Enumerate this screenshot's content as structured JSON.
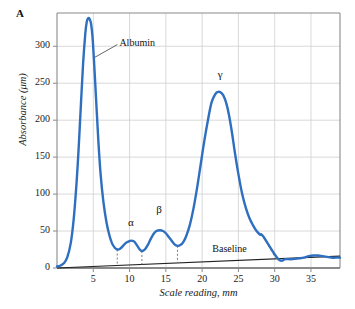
{
  "figure": {
    "panel_label": "A"
  },
  "chart_data": {
    "type": "line",
    "title": "",
    "subtitle": "",
    "xlabel": "Scale reading, mm",
    "ylabel": "Absorbance (μm)",
    "xlim": [
      0,
      39
    ],
    "ylim": [
      0,
      345
    ],
    "grid": true,
    "legend": "none",
    "xticks": [
      5,
      10,
      15,
      20,
      25,
      30,
      35
    ],
    "xtick_labels": [
      "5",
      "10",
      "15",
      "20",
      "25",
      "30",
      "35"
    ],
    "yticks": [
      0,
      50,
      100,
      150,
      200,
      250,
      300
    ],
    "ytick_labels": [
      "0",
      "50",
      "100",
      "150",
      "200",
      "250",
      "300"
    ],
    "series": [
      {
        "name": "densitometer-trace",
        "color": "#2f6fc0",
        "x": [
          0.0,
          0.4,
          0.9,
          1.4,
          1.9,
          2.3,
          2.7,
          3.0,
          3.3,
          3.6,
          3.9,
          4.1,
          4.3,
          4.5,
          4.7,
          4.9,
          5.1,
          5.4,
          5.7,
          6.0,
          6.4,
          6.8,
          7.2,
          7.6,
          8.0,
          8.3,
          8.7,
          9.1,
          9.5,
          9.9,
          10.2,
          10.6,
          11.0,
          11.4,
          11.7,
          12.1,
          12.5,
          12.9,
          13.3,
          13.7,
          14.2,
          14.6,
          15.0,
          15.4,
          15.8,
          16.2,
          16.6,
          17.0,
          17.4,
          17.8,
          18.3,
          18.8,
          19.3,
          19.8,
          20.3,
          20.8,
          21.3,
          21.8,
          22.1,
          22.5,
          22.9,
          23.3,
          23.7,
          24.1,
          24.5,
          25.0,
          25.5,
          26.0,
          26.5,
          27.0,
          27.5,
          28.0,
          28.4,
          30.5,
          31.5,
          32.5,
          33.3,
          34.0,
          34.7,
          35.3,
          36.0,
          36.6,
          37.2,
          37.8,
          38.4,
          39.0
        ],
        "y": [
          2,
          3,
          6,
          14,
          34,
          66,
          116,
          165,
          222,
          277,
          317,
          333,
          338,
          337,
          330,
          312,
          280,
          226,
          172,
          128,
          89,
          63,
          45,
          33,
          27,
          25,
          26,
          30,
          34,
          36,
          37,
          36,
          31,
          25,
          23,
          25,
          31,
          39,
          46,
          50,
          51,
          50,
          47,
          42,
          37,
          32,
          30,
          31,
          35,
          43,
          58,
          80,
          108,
          140,
          172,
          200,
          224,
          235,
          238,
          238,
          234,
          224,
          207,
          184,
          157,
          127,
          101,
          82,
          68,
          58,
          50,
          45,
          43,
          12,
          12,
          12,
          13,
          14,
          16,
          17,
          17,
          16,
          15,
          14,
          14,
          14
        ]
      },
      {
        "name": "baseline",
        "color": "#222222",
        "x": [
          0,
          39
        ],
        "y": [
          0,
          16
        ]
      }
    ],
    "drop_lines": [
      {
        "name": "albumin-alpha-divider",
        "x": 8.3,
        "y_top": 25,
        "y_bottom": 3.4
      },
      {
        "name": "alpha-beta-divider",
        "x": 11.7,
        "y_top": 23,
        "y_bottom": 4.8
      },
      {
        "name": "beta-gamma-divider",
        "x": 16.6,
        "y_top": 30,
        "y_bottom": 6.8
      },
      {
        "name": "gamma-tail-divider",
        "x0": 28.4,
        "y0": 43,
        "x1": 30.2,
        "y1": 12.4
      }
    ],
    "annotations": [
      {
        "name": "albumin",
        "text": "Albumin",
        "x": 8.6,
        "y": 305,
        "leader_from_x": 5.2,
        "leader_from_y": 285
      },
      {
        "name": "alpha",
        "text": "α",
        "x": 10.2,
        "y": 62
      },
      {
        "name": "beta",
        "text": "β",
        "x": 14.1,
        "y": 80
      },
      {
        "name": "gamma",
        "text": "γ",
        "x": 22.5,
        "y": 262
      },
      {
        "name": "baseline",
        "text": "Baseline",
        "x": 21.4,
        "y": 26
      }
    ],
    "colors": {
      "trace": "#2f6fc0",
      "baseline": "#222222",
      "grid": "#cfcfcf",
      "frame": "#8a8a8a",
      "axis_text": "#1a1a1a"
    }
  }
}
